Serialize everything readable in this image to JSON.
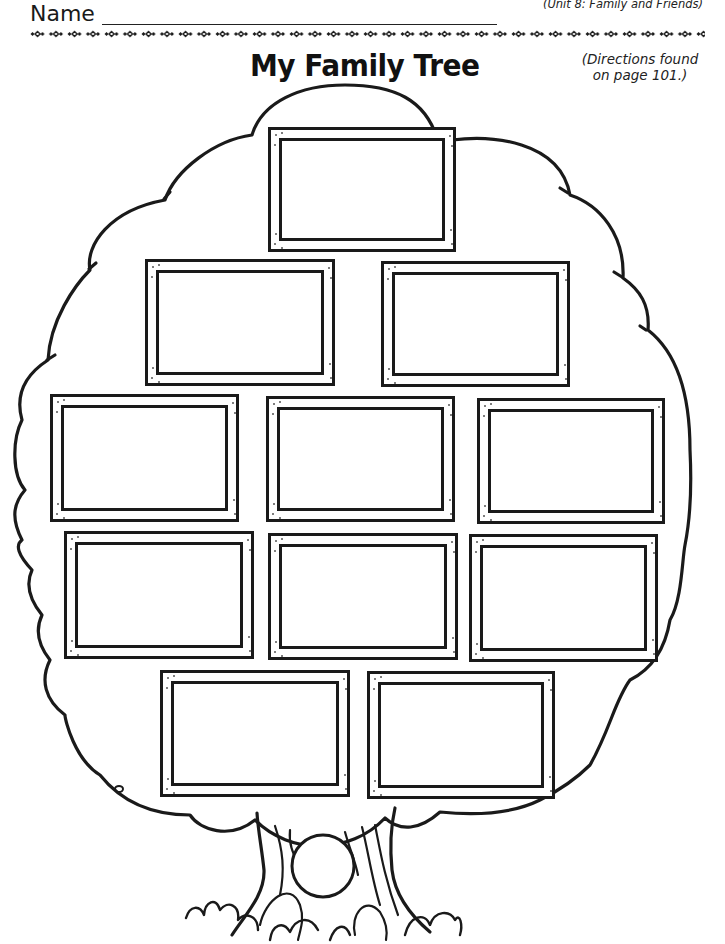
{
  "header": {
    "name_label": "Name",
    "unit_label": "(Unit 8: Family and Friends)",
    "title": "My Family Tree",
    "directions_line1": "(Directions found",
    "directions_line2": "on page 101.)"
  },
  "colors": {
    "ink": "#1a1a1a",
    "paper": "#ffffff"
  },
  "tree": {
    "frames": [
      {
        "id": "frame-1",
        "row": 1,
        "x": 268,
        "y": 127,
        "w": 188,
        "h": 125
      },
      {
        "id": "frame-2",
        "row": 2,
        "x": 145,
        "y": 259,
        "w": 190,
        "h": 127
      },
      {
        "id": "frame-3",
        "row": 2,
        "x": 381,
        "y": 261,
        "w": 189,
        "h": 126
      },
      {
        "id": "frame-4",
        "row": 3,
        "x": 50,
        "y": 394,
        "w": 189,
        "h": 128
      },
      {
        "id": "frame-5",
        "row": 3,
        "x": 266,
        "y": 396,
        "w": 189,
        "h": 126
      },
      {
        "id": "frame-6",
        "row": 3,
        "x": 477,
        "y": 398,
        "w": 188,
        "h": 126
      },
      {
        "id": "frame-7",
        "row": 4,
        "x": 64,
        "y": 531,
        "w": 190,
        "h": 128
      },
      {
        "id": "frame-8",
        "row": 4,
        "x": 268,
        "y": 533,
        "w": 190,
        "h": 127
      },
      {
        "id": "frame-9",
        "row": 4,
        "x": 469,
        "y": 534,
        "w": 189,
        "h": 128
      },
      {
        "id": "frame-10",
        "row": 5,
        "x": 160,
        "y": 670,
        "w": 190,
        "h": 127
      },
      {
        "id": "frame-11",
        "row": 5,
        "x": 367,
        "y": 671,
        "w": 188,
        "h": 128
      }
    ],
    "trunk_circle": {
      "cx": 323,
      "cy": 866,
      "r": 31
    }
  }
}
